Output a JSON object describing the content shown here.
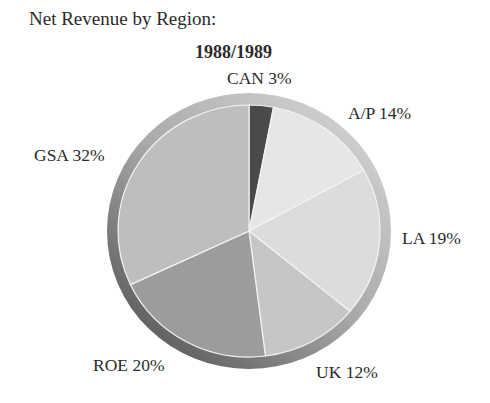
{
  "chart_data": {
    "type": "pie",
    "title": "Net Revenue by Region:",
    "subtitle": "1988/1989",
    "categories": [
      "CAN",
      "A/P",
      "LA",
      "UK",
      "ROE",
      "GSA"
    ],
    "values": [
      3,
      14,
      19,
      12,
      20,
      32
    ],
    "unit": "%",
    "start_angle_deg": 0,
    "direction": "clockwise",
    "colors": [
      "#4a4a4a",
      "#e6e6e6",
      "#dcdcdc",
      "#c6c6c6",
      "#9c9c9c",
      "#bebebe"
    ],
    "labels": [
      {
        "text": "CAN 3%"
      },
      {
        "text": "A/P 14%"
      },
      {
        "text": "LA 19%"
      },
      {
        "text": "UK 12%"
      },
      {
        "text": "ROE 20%"
      },
      {
        "text": "GSA 32%"
      }
    ],
    "legend": "none (labels placed around pie)"
  }
}
